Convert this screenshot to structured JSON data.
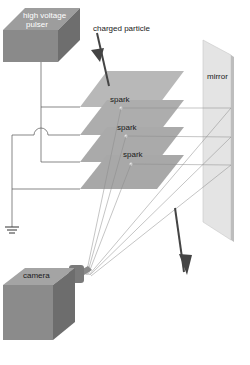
{
  "diagram": {
    "labels": {
      "pulser": [
        "high voltage",
        "pulser"
      ],
      "particle": "charged particle",
      "mirror": "mirror",
      "spark_1": "spark",
      "spark_2": "spark",
      "spark_3": "spark",
      "camera": "camera"
    },
    "components": [
      "high voltage pulser",
      "charged particle track",
      "spark plates (4)",
      "sparks (3)",
      "mirror",
      "camera",
      "ground"
    ],
    "colors": {
      "box_top": "#9a9a9a",
      "box_front": "#858585",
      "box_side": "#6c6c6c",
      "plate": "#b5b5b5",
      "plate_dark": "#a2a2a2",
      "mirror": "#e2e2e2",
      "wire": "#555555",
      "arrow": "#4a4a4a",
      "ray": "#8a8a8a"
    }
  }
}
